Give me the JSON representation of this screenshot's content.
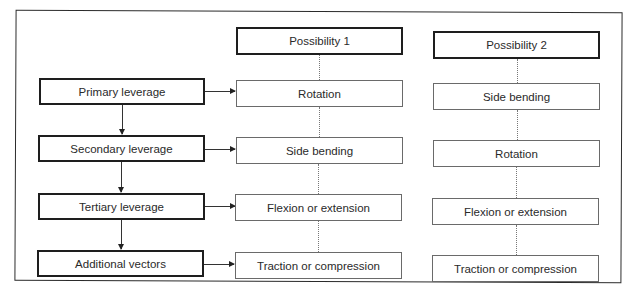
{
  "diagram": {
    "levers": [
      {
        "label": "Primary leverage"
      },
      {
        "label": "Secondary leverage"
      },
      {
        "label": "Tertiary leverage"
      },
      {
        "label": "Additional vectors"
      }
    ],
    "possibility_1": {
      "header": "Possibility 1",
      "items": [
        {
          "label": "Rotation"
        },
        {
          "label": "Side bending"
        },
        {
          "label": "Flexion or extension"
        },
        {
          "label": "Traction or compression"
        }
      ]
    },
    "possibility_2": {
      "header": "Possibility 2",
      "items": [
        {
          "label": "Side bending"
        },
        {
          "label": "Rotation"
        },
        {
          "label": "Flexion or extension"
        },
        {
          "label": "Traction or compression"
        }
      ]
    }
  }
}
